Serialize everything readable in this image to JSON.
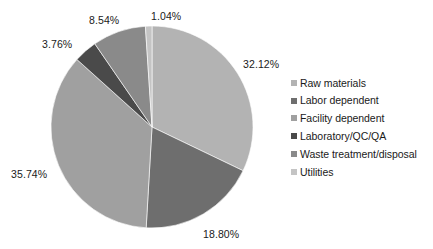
{
  "chart_data": {
    "type": "pie",
    "title": "",
    "subtitle": "",
    "xlabel": "",
    "ylabel": "",
    "grid": false,
    "legend_position": "right",
    "start_angle_deg": 0,
    "direction": "clockwise",
    "units": "percent",
    "categories": [
      "Raw materials",
      "Labor dependent",
      "Facility dependent",
      "Laboratory/QC/QA",
      "Waste treatment/disposal",
      "Utilities"
    ],
    "values": [
      32.12,
      18.8,
      35.74,
      3.76,
      8.54,
      1.04
    ],
    "value_labels": [
      "32.12%",
      "18.80%",
      "35.74%",
      "3.76%",
      "8.54%",
      "1.04%"
    ],
    "colors": [
      "#b3b3b3",
      "#6e6e6e",
      "#a0a0a0",
      "#4a4a4a",
      "#8a8a8a",
      "#c4c4c4"
    ],
    "slices": [
      {
        "name": "Raw materials",
        "value": 32.12,
        "label": "32.12%",
        "color": "#b3b3b3",
        "label_x": 243,
        "label_y": 58
      },
      {
        "name": "Labor dependent",
        "value": 18.8,
        "label": "18.80%",
        "color": "#6e6e6e",
        "label_x": 203,
        "label_y": 228
      },
      {
        "name": "Facility dependent",
        "value": 35.74,
        "label": "35.74%",
        "color": "#a0a0a0",
        "label_x": 11,
        "label_y": 168
      },
      {
        "name": "Laboratory/QC/QA",
        "value": 3.76,
        "label": "3.76%",
        "color": "#4a4a4a",
        "label_x": 42,
        "label_y": 38
      },
      {
        "name": "Waste treatment/disposal",
        "value": 8.54,
        "label": "8.54%",
        "color": "#8a8a8a",
        "label_x": 89,
        "label_y": 14
      },
      {
        "name": "Utilities",
        "value": 1.04,
        "label": "1.04%",
        "color": "#c4c4c4",
        "label_x": 151,
        "label_y": 10
      }
    ],
    "geometry": {
      "center_x": 152,
      "center_y": 127,
      "radius": 101
    }
  },
  "legend": {
    "items": [
      {
        "label": "Raw materials",
        "color": "#b3b3b3"
      },
      {
        "label": "Labor dependent",
        "color": "#6e6e6e"
      },
      {
        "label": "Facility dependent",
        "color": "#a0a0a0"
      },
      {
        "label": "Laboratory/QC/QA",
        "color": "#4a4a4a"
      },
      {
        "label": "Waste treatment/disposal",
        "color": "#8a8a8a"
      },
      {
        "label": "Utilities",
        "color": "#c4c4c4"
      }
    ]
  }
}
